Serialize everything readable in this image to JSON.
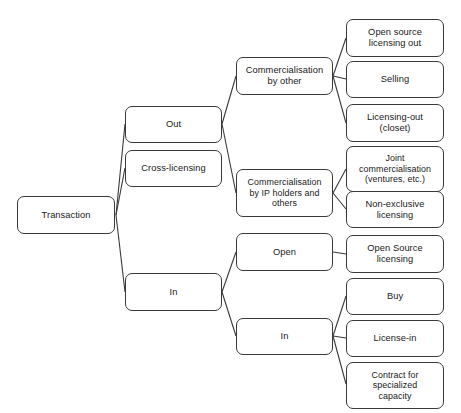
{
  "diagram": {
    "type": "tree",
    "title": "Transaction",
    "orientation": "left-to-right",
    "background_color": "#ffffff",
    "node_border_color": "#3a3a3a",
    "node_fill_color": "#ffffff",
    "connector_color": "#3a3a3a",
    "nodes": [
      {
        "id": "transaction",
        "label": "Transaction",
        "x": 17,
        "y": 196,
        "w": 98,
        "h": 38,
        "level": 0
      },
      {
        "id": "out",
        "label": "Out",
        "x": 125,
        "y": 106,
        "w": 97,
        "h": 37,
        "level": 1
      },
      {
        "id": "cross-licensing",
        "label": "Cross-licensing",
        "x": 125,
        "y": 150,
        "w": 97,
        "h": 37,
        "level": 1
      },
      {
        "id": "in-level1",
        "label": "In",
        "x": 125,
        "y": 273,
        "w": 97,
        "h": 38,
        "level": 1
      },
      {
        "id": "comm-by-other",
        "label": "Commercialisation\nby other",
        "x": 236,
        "y": 57,
        "w": 97,
        "h": 38,
        "level": 2
      },
      {
        "id": "comm-by-ip-holders",
        "label": "Commercialisation\nby IP holders and\nothers",
        "x": 236,
        "y": 169,
        "w": 97,
        "h": 48,
        "level": 2
      },
      {
        "id": "open",
        "label": "Open",
        "x": 236,
        "y": 233,
        "w": 97,
        "h": 38,
        "level": 2
      },
      {
        "id": "in-level2",
        "label": "In",
        "x": 236,
        "y": 318,
        "w": 97,
        "h": 37,
        "level": 2
      },
      {
        "id": "open-source-out",
        "label": "Open source\nlicensing out",
        "x": 346,
        "y": 19,
        "w": 98,
        "h": 38,
        "level": 3
      },
      {
        "id": "selling",
        "label": "Selling",
        "x": 346,
        "y": 61,
        "w": 98,
        "h": 37,
        "level": 3
      },
      {
        "id": "licensing-out",
        "label": "Licensing-out\n(closet)",
        "x": 346,
        "y": 104,
        "w": 98,
        "h": 38,
        "level": 3
      },
      {
        "id": "joint-comm",
        "label": "Joint\ncommercialisation\n(ventures, etc.)",
        "x": 346,
        "y": 146,
        "w": 98,
        "h": 46,
        "level": 3
      },
      {
        "id": "non-exclusive",
        "label": "Non-exclusive\nlicensing",
        "x": 346,
        "y": 191,
        "w": 98,
        "h": 37,
        "level": 3
      },
      {
        "id": "open-source-lic",
        "label": "Open Source\nlicensing",
        "x": 346,
        "y": 235,
        "w": 98,
        "h": 38,
        "level": 3
      },
      {
        "id": "buy",
        "label": "Buy",
        "x": 346,
        "y": 278,
        "w": 98,
        "h": 37,
        "level": 3
      },
      {
        "id": "license-in",
        "label": "License-in",
        "x": 346,
        "y": 320,
        "w": 98,
        "h": 37,
        "level": 3
      },
      {
        "id": "contract-spec",
        "label": "Contract for\nspecialized\ncapacity",
        "x": 346,
        "y": 362,
        "w": 98,
        "h": 47,
        "level": 3
      }
    ],
    "edges": [
      {
        "from": "transaction",
        "to": "out",
        "x1": 116,
        "y1": 215,
        "x2": 125,
        "y2": 124
      },
      {
        "from": "transaction",
        "to": "cross-licensing",
        "x1": 116,
        "y1": 215,
        "x2": 125,
        "y2": 168
      },
      {
        "from": "transaction",
        "to": "in-level1",
        "x1": 116,
        "y1": 215,
        "x2": 125,
        "y2": 292
      },
      {
        "from": "out",
        "to": "comm-by-other",
        "x1": 222,
        "y1": 124,
        "x2": 236,
        "y2": 76
      },
      {
        "from": "out",
        "to": "comm-by-ip-holders",
        "x1": 222,
        "y1": 124,
        "x2": 236,
        "y2": 193
      },
      {
        "from": "in-level1",
        "to": "open",
        "x1": 222,
        "y1": 292,
        "x2": 236,
        "y2": 252
      },
      {
        "from": "in-level1",
        "to": "in-level2",
        "x1": 222,
        "y1": 292,
        "x2": 236,
        "y2": 336
      },
      {
        "from": "comm-by-other",
        "to": "open-source-out",
        "x1": 333,
        "y1": 76,
        "x2": 346,
        "y2": 38
      },
      {
        "from": "comm-by-other",
        "to": "selling",
        "x1": 333,
        "y1": 76,
        "x2": 346,
        "y2": 79
      },
      {
        "from": "comm-by-other",
        "to": "licensing-out",
        "x1": 333,
        "y1": 76,
        "x2": 346,
        "y2": 123
      },
      {
        "from": "comm-by-ip-holders",
        "to": "joint-comm",
        "x1": 333,
        "y1": 193,
        "x2": 346,
        "y2": 169
      },
      {
        "from": "comm-by-ip-holders",
        "to": "non-exclusive",
        "x1": 333,
        "y1": 193,
        "x2": 346,
        "y2": 209
      },
      {
        "from": "open",
        "to": "open-source-lic",
        "x1": 333,
        "y1": 252,
        "x2": 346,
        "y2": 254
      },
      {
        "from": "in-level2",
        "to": "buy",
        "x1": 333,
        "y1": 336,
        "x2": 346,
        "y2": 296
      },
      {
        "from": "in-level2",
        "to": "license-in",
        "x1": 333,
        "y1": 336,
        "x2": 346,
        "y2": 338
      },
      {
        "from": "in-level2",
        "to": "contract-spec",
        "x1": 333,
        "y1": 336,
        "x2": 346,
        "y2": 384
      }
    ]
  }
}
